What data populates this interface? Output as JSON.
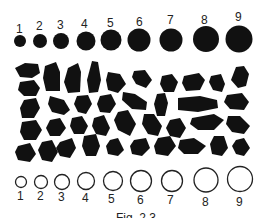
{
  "figure": {
    "caption": "Fig. 2.3",
    "top_scale": {
      "description": "Filled circles increasing in size",
      "labels": [
        "1",
        "2",
        "3",
        "4",
        "5",
        "6",
        "7",
        "8",
        "9"
      ]
    },
    "bottom_scale": {
      "description": "Open circles increasing in size",
      "labels": [
        "1",
        "2",
        "3",
        "4",
        "5",
        "6",
        "7",
        "8",
        "9"
      ]
    },
    "particles": {
      "description": "Irregular black angular particles arranged in rows"
    },
    "colors": {
      "fill": "#111111",
      "background": "#ffffff"
    }
  }
}
